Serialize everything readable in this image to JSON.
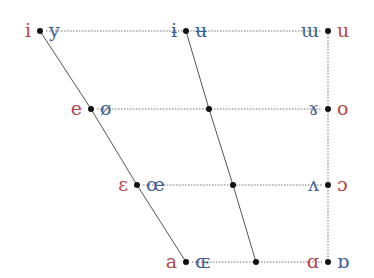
{
  "colors": {
    "unrounded": "#b8454a",
    "rounded": "#3f5f94",
    "line": "#555555",
    "dot": "#111111"
  },
  "rows": [
    {
      "name": "close",
      "y": 31,
      "points": [
        {
          "x": 40,
          "left": "i",
          "right": "y",
          "left_color": "unrounded",
          "right_color": "rounded"
        },
        {
          "x": 186,
          "left": "ɨ",
          "right": "ʉ",
          "left_color": "rounded",
          "right_color": "rounded"
        },
        {
          "x": 328,
          "left": "ɯ",
          "right": "u",
          "left_color": "rounded",
          "right_color": "unrounded"
        }
      ]
    },
    {
      "name": "close-mid",
      "y": 109,
      "points": [
        {
          "x": 91,
          "left": "e",
          "right": "ø",
          "left_color": "unrounded",
          "right_color": "rounded"
        },
        {
          "x": 209,
          "left": "",
          "right": ""
        },
        {
          "x": 328,
          "left": "ɤ",
          "right": "o",
          "left_color": "rounded",
          "right_color": "unrounded"
        }
      ]
    },
    {
      "name": "open-mid",
      "y": 185,
      "points": [
        {
          "x": 137,
          "left": "ɛ",
          "right": "œ",
          "left_color": "unrounded",
          "right_color": "rounded"
        },
        {
          "x": 233,
          "left": "",
          "right": ""
        },
        {
          "x": 328,
          "left": "ʌ",
          "right": "ɔ",
          "left_color": "rounded",
          "right_color": "unrounded"
        }
      ]
    },
    {
      "name": "open",
      "y": 262,
      "points": [
        {
          "x": 186,
          "left": "a",
          "right": "ɶ",
          "left_color": "unrounded",
          "right_color": "rounded"
        },
        {
          "x": 256,
          "left": "",
          "right": ""
        },
        {
          "x": 328,
          "left": "ɑ",
          "right": "ɒ",
          "left_color": "unrounded",
          "right_color": "rounded"
        }
      ]
    }
  ]
}
